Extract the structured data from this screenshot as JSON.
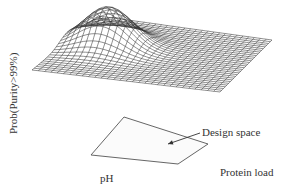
{
  "figure": {
    "type": "3d-surface-diagram",
    "y_axis_label": "Prob(Purity>99%)",
    "x_axis_label": "pH",
    "z_axis_label": "Protein load",
    "annotation": "Design space",
    "colors": {
      "mesh": "#333333",
      "polygon": "#555555",
      "text": "#333333",
      "background": "#ffffff"
    }
  },
  "surface": {
    "grid_size": 30,
    "corners": {
      "back": [
        98,
        16
      ],
      "right": [
        272,
        40
      ],
      "front": [
        220,
        92
      ],
      "left": [
        32,
        70
      ]
    },
    "peak": {
      "u": 0.22,
      "v": 0.55,
      "height": 38,
      "sigma": 0.13
    }
  },
  "design_space_polygon": [
    [
      124,
      117
    ],
    [
      208,
      144
    ],
    [
      178,
      164
    ],
    [
      91,
      155
    ]
  ],
  "arrow": {
    "from": [
      200,
      133
    ],
    "to": [
      168,
      144
    ]
  }
}
